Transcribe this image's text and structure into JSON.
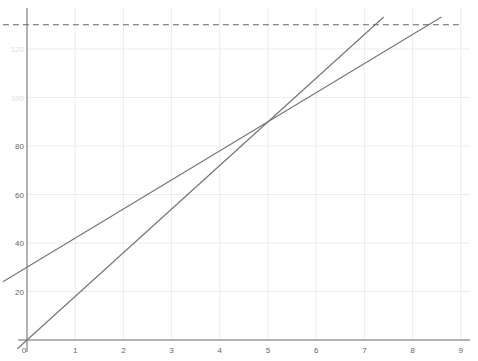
{
  "chart_data": {
    "type": "line",
    "title": "",
    "xlabel": "",
    "ylabel": "",
    "xlim": [
      -0.5,
      9
    ],
    "ylim": [
      -8,
      140
    ],
    "grid": true,
    "x_ticks": [
      "0",
      "1",
      "2",
      "3",
      "4",
      "5",
      "6",
      "7",
      "8",
      "9"
    ],
    "y_ticks": [
      "20",
      "40",
      "60",
      "80",
      "100",
      "120"
    ],
    "series": [
      {
        "name": "y = 30 + 12x",
        "intercept": 30,
        "slope": 12,
        "x": [
          -0.5,
          8.6
        ],
        "y": [
          24,
          133.2
        ],
        "style": "solid",
        "color": "#777777"
      },
      {
        "name": "y = 18x",
        "intercept": 0,
        "slope": 18,
        "x": [
          -0.2,
          7.4
        ],
        "y": [
          -3.6,
          133.2
        ],
        "style": "solid",
        "color": "#777777"
      },
      {
        "name": "y = 130",
        "intercept": 130,
        "slope": 0,
        "x": [
          -0.5,
          9
        ],
        "y": [
          130,
          130
        ],
        "style": "dashed",
        "color": "#666666"
      }
    ],
    "intersection": {
      "x": 5,
      "y": 90
    },
    "legend": []
  }
}
